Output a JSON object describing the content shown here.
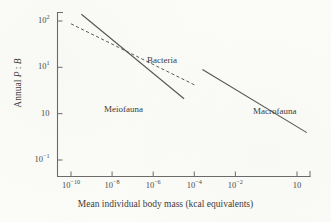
{
  "figure": {
    "background_color": "#fbfbf8",
    "ink_color": "#555555"
  },
  "chart_data": {
    "type": "line",
    "title": "",
    "subtitle": "",
    "xlabel": "Mean individual body mass (kcal equivalents)",
    "ylabel": "Annual P : B",
    "ylabel_parts": {
      "prefix": "Annual ",
      "p": "P",
      "sep": " : ",
      "b": "B"
    },
    "xscale": "log",
    "yscale": "log",
    "xlim": [
      1e-11,
      60
    ],
    "ylim": [
      0.1,
      100
    ],
    "grid": false,
    "legend": "inline-annotations",
    "xticks": [
      {
        "value": 1e-10,
        "label": "10",
        "exponent": "−10"
      },
      {
        "value": 1e-08,
        "label": "10",
        "exponent": "−8"
      },
      {
        "value": 1e-06,
        "label": "10",
        "exponent": "−6"
      },
      {
        "value": 0.0001,
        "label": "10",
        "exponent": "−4"
      },
      {
        "value": 0.01,
        "label": "10",
        "exponent": "−2"
      },
      {
        "value": 10,
        "label": "10",
        "exponent": ""
      }
    ],
    "yticks": [
      {
        "value": 100,
        "label": "10",
        "exponent": "2"
      },
      {
        "value": 10,
        "label": "10",
        "exponent": "1"
      },
      {
        "value": 1,
        "label": "10",
        "exponent": ""
      },
      {
        "value": 0.1,
        "label": "10",
        "exponent": "−1"
      }
    ],
    "series": [
      {
        "name": "Bacteria",
        "style": "dashed",
        "color": "#5a5a5a",
        "annotation": "Bacteria",
        "points": [
          {
            "x": 1e-10,
            "y": 87
          },
          {
            "x": 0.0001,
            "y": 4.2
          }
        ]
      },
      {
        "name": "Meiofauna",
        "style": "solid",
        "color": "#555555",
        "annotation": "Meiofauna",
        "points": [
          {
            "x": 3.2e-10,
            "y": 140
          },
          {
            "x": 3.2e-05,
            "y": 2.1
          }
        ]
      },
      {
        "name": "Macrofauna",
        "style": "solid",
        "color": "#555555",
        "annotation": "Macrofauna",
        "points": [
          {
            "x": 0.00025,
            "y": 9.0
          },
          {
            "x": 30,
            "y": 0.39
          }
        ]
      }
    ],
    "annotations": [
      {
        "text": "Bacteria",
        "x_px": 147,
        "y_px": 55
      },
      {
        "text": "Meiofauna",
        "x_px": 104,
        "y_px": 104
      },
      {
        "text": "Macrofauna",
        "x_px": 253,
        "y_px": 106
      }
    ]
  }
}
